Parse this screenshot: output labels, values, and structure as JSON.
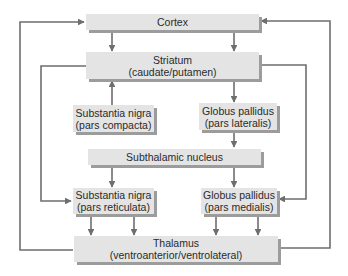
{
  "diagram": {
    "colors": {
      "box_fill": "#e4e4e4",
      "box_shadow": "#9c9c9c",
      "line": "#6e6e6e",
      "text": "#2a2a2a"
    },
    "nodes": {
      "cortex": {
        "line1": "Cortex"
      },
      "striatum": {
        "line1": "Striatum",
        "line2": "(caudate/putamen)"
      },
      "sn_compacta": {
        "line1": "Substantia nigra",
        "line2": "(pars compacta)"
      },
      "gp_lateralis": {
        "line1": "Globus pallidus",
        "line2": "(pars lateralis)"
      },
      "subthalamic": {
        "line1": "Subthalamic nucleus"
      },
      "sn_reticulata": {
        "line1": "Substantia nigra",
        "line2": "(pars reticulata)"
      },
      "gp_medialis": {
        "line1": "Globus pallidus",
        "line2": "(pars medialis)"
      },
      "thalamus": {
        "line1": "Thalamus",
        "line2": "(ventroanterior/ventrolateral)"
      }
    },
    "edges": [
      {
        "from": "cortex",
        "to": "striatum",
        "count": 2
      },
      {
        "from": "sn_compacta",
        "to": "striatum"
      },
      {
        "from": "striatum",
        "to": "gp_lateralis"
      },
      {
        "from": "gp_lateralis",
        "to": "subthalamic"
      },
      {
        "from": "subthalamic",
        "to": "sn_reticulata"
      },
      {
        "from": "subthalamic",
        "to": "gp_medialis"
      },
      {
        "from": "striatum",
        "to": "sn_reticulata"
      },
      {
        "from": "striatum",
        "to": "gp_medialis"
      },
      {
        "from": "sn_reticulata",
        "to": "thalamus",
        "count": 2
      },
      {
        "from": "gp_medialis",
        "to": "thalamus",
        "count": 2
      },
      {
        "from": "thalamus",
        "to": "cortex",
        "count": 2
      }
    ]
  }
}
